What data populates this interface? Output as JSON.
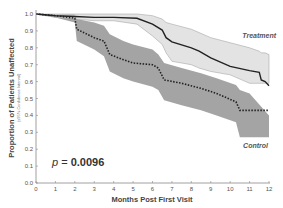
{
  "chart_data": {
    "type": "line",
    "title": "",
    "xlabel": "Months Post First Visit",
    "ylabel": "Proportion of Patients Unaffected",
    "ylabel_sub": "(±95% Confidence Interval)",
    "xlim": [
      0,
      12
    ],
    "ylim": [
      0.0,
      1.0
    ],
    "xticks": [
      0,
      1,
      2,
      3,
      4,
      5,
      6,
      7,
      8,
      9,
      10,
      11,
      12
    ],
    "yticks": [
      "0.0",
      "0.1",
      "0.2",
      "0.3",
      "0.4",
      "0.5",
      "0.6",
      "0.7",
      "0.8",
      "0.9",
      "1.0"
    ],
    "grid": false,
    "annotation": {
      "prefix": "p",
      "text": " = ",
      "value": "0.0096"
    },
    "series": [
      {
        "name": "Treatment",
        "style": "solid",
        "color": "#222222",
        "band_color": "#d9d9d9",
        "x": [
          0,
          1,
          2,
          3,
          4,
          5.2,
          6,
          6.5,
          6.7,
          7,
          8,
          8.4,
          9,
          10,
          11,
          11.5,
          11.6,
          11.8,
          12
        ],
        "values": [
          1.0,
          0.99,
          0.985,
          0.98,
          0.98,
          0.975,
          0.94,
          0.905,
          0.86,
          0.835,
          0.8,
          0.78,
          0.74,
          0.69,
          0.665,
          0.655,
          0.61,
          0.6,
          0.575
        ],
        "upper": [
          1.0,
          1.0,
          1.0,
          1.0,
          1.0,
          1.0,
          0.99,
          0.97,
          0.95,
          0.94,
          0.91,
          0.89,
          0.86,
          0.83,
          0.8,
          0.78,
          0.77,
          0.77,
          0.76
        ],
        "lower": [
          1.0,
          0.98,
          0.97,
          0.96,
          0.96,
          0.94,
          0.87,
          0.82,
          0.77,
          0.72,
          0.7,
          0.68,
          0.66,
          0.64,
          0.59,
          0.59,
          0.59,
          0.59,
          0.59
        ]
      },
      {
        "name": "Control",
        "style": "dotted",
        "color": "#222222",
        "band_color": "#9a9a9a",
        "x": [
          0,
          1,
          2,
          2.1,
          3,
          3.5,
          3.8,
          4.5,
          5,
          6,
          6.3,
          6.6,
          7.5,
          8.5,
          9.3,
          10.3,
          10.5,
          11,
          12
        ],
        "values": [
          1.0,
          0.99,
          0.975,
          0.91,
          0.86,
          0.84,
          0.76,
          0.73,
          0.71,
          0.7,
          0.68,
          0.61,
          0.59,
          0.56,
          0.53,
          0.48,
          0.43,
          0.43,
          0.43
        ],
        "upper": [
          1.0,
          1.0,
          1.0,
          0.97,
          0.95,
          0.93,
          0.88,
          0.84,
          0.82,
          0.79,
          0.76,
          0.71,
          0.68,
          0.65,
          0.62,
          0.58,
          0.55,
          0.53,
          0.4
        ],
        "lower": [
          1.0,
          0.98,
          0.95,
          0.84,
          0.79,
          0.75,
          0.66,
          0.62,
          0.6,
          0.57,
          0.55,
          0.49,
          0.46,
          0.43,
          0.4,
          0.36,
          0.27,
          0.27,
          0.27
        ]
      }
    ]
  }
}
